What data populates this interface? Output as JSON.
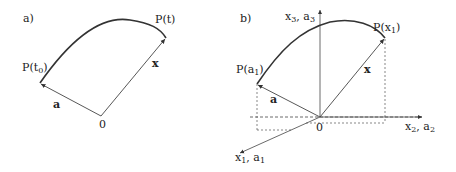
{
  "panel_a": {
    "label": "a)",
    "start_point": "P(t",
    "start_point_sub": "0",
    "end_point": "P(t)",
    "vector_a": "a",
    "vector_x": "x",
    "origin": "0"
  },
  "panel_b": {
    "label": "b)",
    "start_point": "P(a",
    "start_point_sub": "1",
    "end_point": "P(x",
    "end_point_sub": "1",
    "vector_a": "a",
    "vector_x": "x",
    "origin": "0",
    "axis_vertical": {
      "v1": "x",
      "s1": "3",
      "sep": ", ",
      "v2": "a",
      "s2": "3"
    },
    "axis_horizontal": {
      "v1": "x",
      "s1": "2",
      "sep": ", ",
      "v2": "a",
      "s2": "2"
    },
    "axis_oblique": {
      "v1": "x",
      "s1": "1",
      "sep": ", ",
      "v2": "a",
      "s2": "1"
    }
  },
  "colors": {
    "stroke": "#333333",
    "text": "#222222"
  }
}
